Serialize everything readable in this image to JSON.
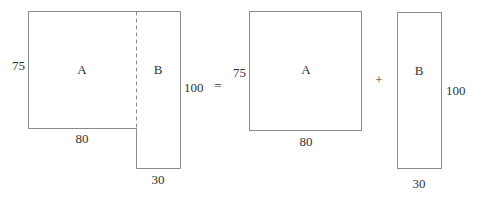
{
  "diagram": {
    "left_figure": {
      "region_a": {
        "label": "A",
        "height_label": "75",
        "width_label": "80"
      },
      "region_b": {
        "label": "B",
        "height_label": "100",
        "width_label": "30"
      }
    },
    "equals_sign": "=",
    "plus_sign": "+",
    "right_rect_a": {
      "label": "A",
      "height_label": "75",
      "width_label": "80"
    },
    "right_rect_b": {
      "label": "B",
      "height_label": "100",
      "width_label": "30"
    },
    "colors": {
      "stroke": "#8a8a8a",
      "text": "#333333",
      "background": "#ffffff"
    }
  }
}
